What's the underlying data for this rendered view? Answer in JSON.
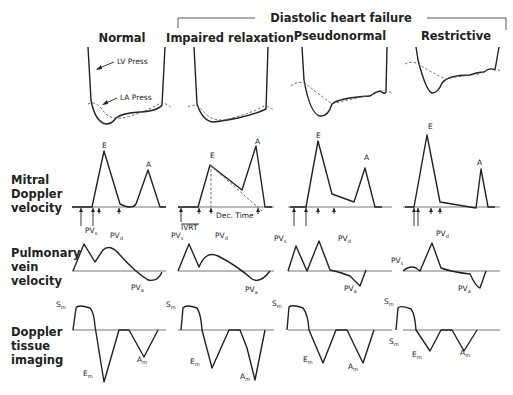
{
  "figure": {
    "group_title": "Diastolic heart failure",
    "columns": [
      {
        "id": "normal",
        "title": "Normal"
      },
      {
        "id": "impaired",
        "title": "Impaired relaxation"
      },
      {
        "id": "pseudonormal",
        "title": "Pseudonormal"
      },
      {
        "id": "restrictive",
        "title": "Restrictive"
      }
    ],
    "rows": [
      {
        "id": "pressure",
        "label": []
      },
      {
        "id": "mitral",
        "label": [
          "Mitral",
          "Doppler",
          "velocity"
        ]
      },
      {
        "id": "pulm",
        "label": [
          "Pulmonary",
          "vein",
          "velocity"
        ]
      },
      {
        "id": "tissue",
        "label": [
          "Doppler",
          "tissue",
          "imaging"
        ]
      }
    ],
    "annotations": {
      "lv_press": "LV Press",
      "la_press": "LA Press",
      "ivrt": "IVRT",
      "dec_time": "Dec. Time",
      "E": "E",
      "A": "A",
      "PV": "PV",
      "s": "s",
      "d": "d",
      "a": "a",
      "S": "S",
      "E_m": "E",
      "A_m": "A",
      "m": "m"
    }
  },
  "panels": {
    "pressure": [
      {
        "lv": "M88,47 L91,100 Q95,122 106,124 Q112,124 116,118 Q122,113 140,112 Q158,111 162,105 L165,47",
        "la": "M88,104 Q96,100 104,112 Q112,122 130,116 Q150,110 162,102 Q168,105 172,108"
      },
      {
        "lv": "M194,47 L197,104 Q203,122 214,122 Q222,121 238,118 Q256,114 266,109 L268,47",
        "la": "M188,107 Q196,102 204,112 Q214,124 232,118 Q252,113 264,106 Q270,107 274,110"
      },
      {
        "lv": "M302,47 L304,80 Q310,114 320,116 Q328,117 332,104 Q338,98 370,96 Q375,92 380,91 Q385,95 386,92 L387,47",
        "la": "M291,86 Q298,80 306,84 Q316,92 332,104 Q346,100 372,95 Q380,88 392,93"
      },
      {
        "lv": "M416,47 L418,60 Q426,91 432,93 Q438,93 442,83 Q448,75 470,75 Q478,72 484,72 Q490,67 495,70 L499,47",
        "la": "M405,64 Q412,60 420,65 Q430,72 446,79 Q460,76 480,74 Q492,65 500,71"
      }
    ],
    "mitral": {
      "baseline_y": 207,
      "curves": [
        "M72,207 L92,207 L104,151 L120,204 Q132,210 136,204 L148,170 L160,207 L166,207",
        "M178,207 L198,207 L210,165 L242,190 L256,146 L265,207 L272,207",
        "M290,207 L306,207 L318,141 L332,194 L354,202 L365,168 L375,207 L382,207",
        "M405,207 L414,207 L427,135 L440,202 L476,208 L481,169 L488,207 L495,207"
      ],
      "E_pos": [
        [
          104,
          148
        ],
        [
          212,
          158
        ],
        [
          318,
          138
        ],
        [
          430,
          129
        ]
      ],
      "A_pos": [
        [
          148,
          167
        ],
        [
          257,
          144
        ],
        [
          366,
          160
        ],
        [
          479,
          165
        ]
      ],
      "arrows": [
        [
          [
            81,
            226
          ],
          [
            93,
            226
          ],
          [
            99,
            214
          ],
          [
            119,
            214
          ]
        ],
        [
          [
            181,
            222
          ],
          [
            199,
            214
          ],
          [
            211,
            214
          ],
          [
            258,
            214
          ]
        ],
        [
          [
            294,
            226
          ],
          [
            306,
            226
          ],
          [
            318,
            214
          ],
          [
            334,
            214
          ]
        ],
        [
          [
            414,
            226
          ],
          [
            418,
            226
          ],
          [
            431,
            214
          ],
          [
            440,
            214
          ]
        ]
      ],
      "dec_dash": "M210,165 L262,211",
      "dec_vline": "M211,165 L211,207",
      "ivrt_pos": [
        193,
        230
      ],
      "dec_pos": [
        226,
        218
      ]
    },
    "pulm": {
      "baseline_y": 271,
      "curves": [
        "M73,271 L84,244 L95,262 L103,250 Q110,243 120,255 Q135,272 148,280 Q158,282 162,272",
        "M178,271 L189,244 L199,267 Q206,250 218,256 Q236,265 252,279 Q260,284 270,271",
        "M288,271 L296,246 L307,271 L319,241 L330,270 Q340,272 350,276 L360,286 L366,270",
        "M403,271 Q410,265 416,268 L420,271 L432,243 L441,268 Q452,272 470,274 Q476,287 480,288 L486,271"
      ],
      "labels": [
        {
          "s": [
            85,
            233
          ],
          "d": [
            110,
            238
          ],
          "a": [
            131,
            290
          ]
        },
        {
          "s": [
            171,
            238
          ],
          "d": [
            215,
            238
          ],
          "a": [
            245,
            292
          ]
        },
        {
          "s": [
            274,
            241
          ],
          "d": [
            338,
            241
          ],
          "a": [
            344,
            291
          ]
        },
        {
          "s": [
            391,
            263
          ],
          "d": [
            436,
            236
          ],
          "a": [
            458,
            291
          ]
        }
      ]
    },
    "tissue": {
      "baseline_y": 330,
      "curves": [
        "M73,330 L76,308 Q78,304 90,308 Q94,312 95,326 L104,382 L119,330 L129,330 L144,357 L158,330",
        "M181,330 L183,308 Q186,304 197,308 Q201,314 202,330 L212,368 L229,330 L240,330 L247,348 L255,380 L265,330",
        "M287,330 L289,307 Q292,304 303,308 Q308,314 309,330 L323,363 L336,330 L347,330 L363,363 L374,330",
        "M396,330 L398,308 Q400,305 411,309 Q415,314 416,330 L430,351 L441,330 L452,330 L464,351 L477,330"
      ],
      "labels": [
        {
          "S": [
            56,
            307
          ],
          "E": [
            83,
            376
          ],
          "A": [
            137,
            362
          ]
        },
        {
          "S": [
            166,
            307
          ],
          "E": [
            190,
            364
          ],
          "A": [
            240,
            379
          ]
        },
        {
          "S": [
            272,
            306
          ],
          "E": [
            303,
            362
          ],
          "A": [
            348,
            369
          ]
        },
        {
          "S": [
            384,
            304
          ],
          "S2": [
            389,
            344
          ],
          "E": [
            412,
            357
          ],
          "A": [
            460,
            355
          ]
        }
      ]
    }
  }
}
